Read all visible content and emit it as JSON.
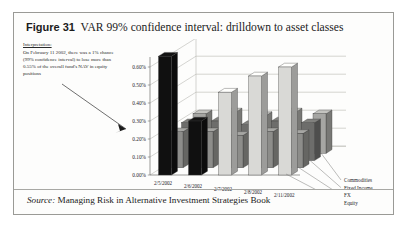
{
  "figure": {
    "number_label": "Figure 31",
    "title": "VAR 99% confidence interval: drilldown to asset classes",
    "source_label": "Source:",
    "source_text": "Managing Risk in Alternative Investment Strategies Book"
  },
  "annotation": {
    "heading": "Interpretation:",
    "body": "On February 11 2002, there was a 1% chance (99% confidence interval) to lose more than 0.55% of the overall fund's NAV in equity positions"
  },
  "colors": {
    "frame_border": "#9a9a96",
    "page_background": "#ffffff",
    "figure_background": "#fdfdfc",
    "text": "#1b1b1b",
    "grid_line": "#b9b9b4",
    "axis_line": "#6e6e6a",
    "equity_dark": "#101010",
    "equity_light": "#d9d9d6",
    "fx": "#8d8d8a",
    "fixed_income": "#6d6d6b",
    "commodities": "#a6a6a3"
  },
  "chart_data": {
    "type": "bar",
    "title": "VAR 99% confidence interval: drilldown to asset classes",
    "xlabel": "",
    "ylabel": "",
    "ylim": [
      0.0,
      0.6
    ],
    "ytick_labels": [
      "0.60%",
      "0.50%",
      "0.40%",
      "0.30%",
      "0.20%",
      "0.10%",
      "0.00%"
    ],
    "ytick_values": [
      0.6,
      0.5,
      0.4,
      0.3,
      0.2,
      0.1,
      0.0
    ],
    "grid": true,
    "three_d": true,
    "legend_position": "right",
    "categories": [
      "2/5/2002",
      "2/6/2002",
      "2/7/2002",
      "2/8/2002",
      "2/11/2002"
    ],
    "series": [
      {
        "name": "Equity",
        "values": [
          0.66,
          0.3,
          0.46,
          0.55,
          0.6
        ]
      },
      {
        "name": "FX",
        "values": [
          0.2,
          0.2,
          0.18,
          0.2,
          0.19
        ]
      },
      {
        "name": "Fixed Income",
        "values": [
          0.21,
          0.22,
          0.2,
          0.22,
          0.21
        ]
      },
      {
        "name": "Commodities",
        "values": [
          0.22,
          0.23,
          0.21,
          0.23,
          0.22
        ]
      }
    ]
  }
}
